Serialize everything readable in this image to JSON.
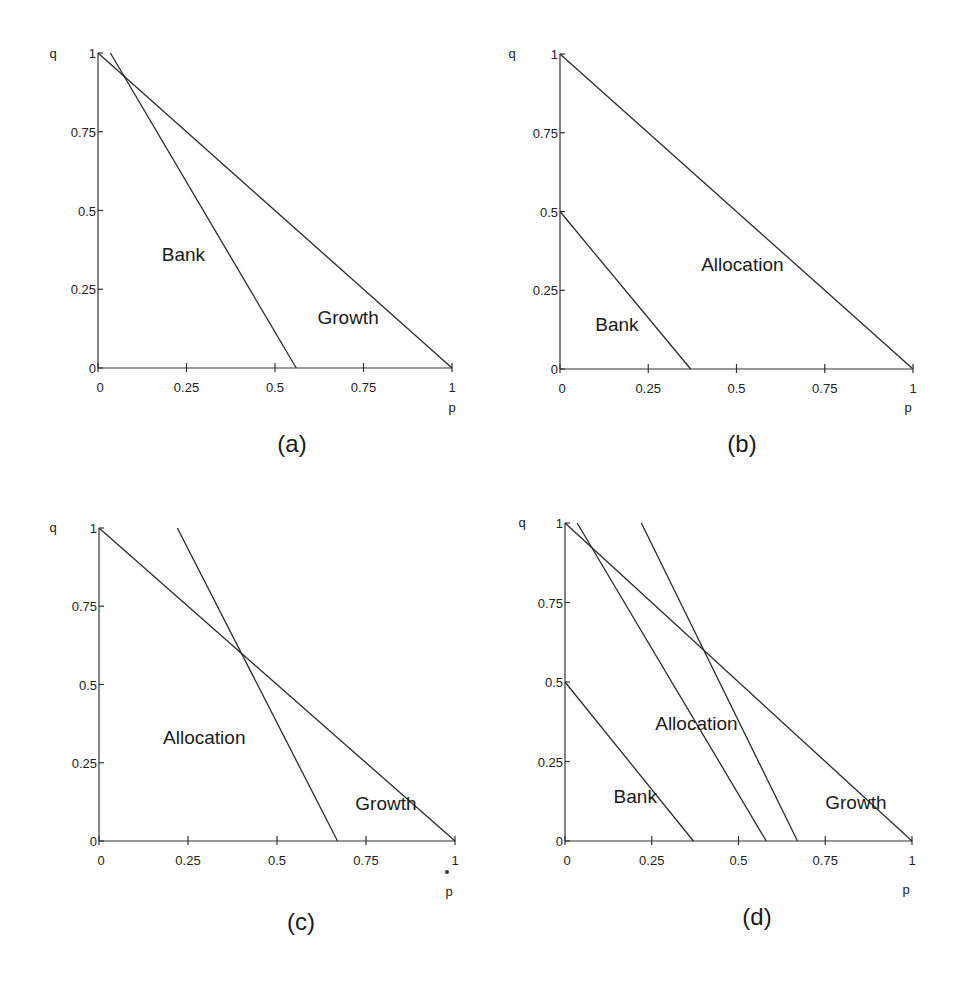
{
  "figure": {
    "ink_color": "#1a1a1a",
    "background": "#ffffff"
  },
  "chart_data": [
    {
      "type": "line",
      "panel": "(a)",
      "xlabel": "p",
      "ylabel": "q",
      "xlim": [
        0,
        1
      ],
      "ylim": [
        0,
        1
      ],
      "x_ticks": [
        "0",
        "0.25",
        "0.5",
        "0.75",
        "1"
      ],
      "y_ticks": [
        "0",
        "0.25",
        "0.5",
        "0.75",
        "1"
      ],
      "grid": false,
      "lines": [
        {
          "name": "p+q=1 boundary",
          "points": [
            [
              0,
              1
            ],
            [
              1,
              0
            ]
          ]
        },
        {
          "name": "Bank/Growth boundary",
          "points": [
            [
              0.035,
              1
            ],
            [
              0.56,
              0
            ]
          ]
        }
      ],
      "region_labels": [
        {
          "text": "Bank",
          "p": 0.18,
          "q": 0.34
        },
        {
          "text": "Growth",
          "p": 0.62,
          "q": 0.14
        }
      ],
      "caption": "(a)"
    },
    {
      "type": "line",
      "panel": "(b)",
      "xlabel": "p",
      "ylabel": "q",
      "xlim": [
        0,
        1
      ],
      "ylim": [
        0,
        1
      ],
      "x_ticks": [
        "0",
        "0.25",
        "0.5",
        "0.75",
        "1"
      ],
      "y_ticks": [
        "0",
        "0.25",
        "0.5",
        "0.75",
        "1"
      ],
      "grid": false,
      "lines": [
        {
          "name": "p+q=1 boundary",
          "points": [
            [
              0,
              1
            ],
            [
              1,
              0
            ]
          ]
        },
        {
          "name": "Bank/Allocation boundary",
          "points": [
            [
              0,
              0.5
            ],
            [
              0.37,
              0
            ]
          ]
        }
      ],
      "region_labels": [
        {
          "text": "Allocation",
          "p": 0.4,
          "q": 0.31
        },
        {
          "text": "Bank",
          "p": 0.1,
          "q": 0.12
        }
      ],
      "caption": "(b)"
    },
    {
      "type": "line",
      "panel": "(c)",
      "xlabel": "p",
      "ylabel": "q",
      "xlim": [
        0,
        1
      ],
      "ylim": [
        0,
        1
      ],
      "x_ticks": [
        "0",
        "0.25",
        "0.5",
        "0.75",
        "1"
      ],
      "y_ticks": [
        "0",
        "0.25",
        "0.5",
        "0.75",
        "1"
      ],
      "grid": false,
      "lines": [
        {
          "name": "p+q=1 boundary",
          "points": [
            [
              0,
              1
            ],
            [
              1,
              0
            ]
          ]
        },
        {
          "name": "Allocation/Growth boundary",
          "points": [
            [
              0.22,
              1
            ],
            [
              0.67,
              0
            ]
          ]
        }
      ],
      "region_labels": [
        {
          "text": "Allocation",
          "p": 0.18,
          "q": 0.31
        },
        {
          "text": "Growth",
          "p": 0.72,
          "q": 0.1
        }
      ],
      "caption": "(c)"
    },
    {
      "type": "line",
      "panel": "(d)",
      "xlabel": "p",
      "ylabel": "q",
      "xlim": [
        0,
        1
      ],
      "ylim": [
        0,
        1
      ],
      "x_ticks": [
        "0",
        "0.25",
        "0.5",
        "0.75",
        "1"
      ],
      "y_ticks": [
        "0",
        "0.25",
        "0.5",
        "0.75",
        "1"
      ],
      "grid": false,
      "lines": [
        {
          "name": "p+q=1 boundary",
          "points": [
            [
              0,
              1
            ],
            [
              1,
              0
            ]
          ]
        },
        {
          "name": "Bank/Allocation boundary",
          "points": [
            [
              0,
              0.5
            ],
            [
              0.37,
              0
            ]
          ]
        },
        {
          "name": "Allocation steep boundary",
          "points": [
            [
              0.035,
              1
            ],
            [
              0.58,
              0
            ]
          ]
        },
        {
          "name": "Allocation/Growth boundary",
          "points": [
            [
              0.22,
              1
            ],
            [
              0.67,
              0
            ]
          ]
        }
      ],
      "region_labels": [
        {
          "text": "Allocation",
          "p": 0.26,
          "q": 0.35
        },
        {
          "text": "Bank",
          "p": 0.14,
          "q": 0.12
        },
        {
          "text": "Growth",
          "p": 0.75,
          "q": 0.1
        }
      ],
      "caption": "(d)"
    }
  ]
}
